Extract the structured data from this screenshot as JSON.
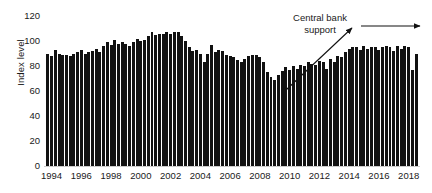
{
  "chart_data": {
    "type": "bar",
    "title": "",
    "xlabel": "",
    "ylabel": "Index level",
    "ylim": [
      0,
      120
    ],
    "yticks": [
      0,
      20,
      40,
      60,
      80,
      100,
      120
    ],
    "xticks": [
      "1994",
      "1996",
      "1998",
      "2000",
      "2002",
      "2004",
      "2006",
      "2008",
      "2010",
      "2012",
      "2014",
      "2016",
      "2018"
    ],
    "grid": false,
    "legend": null,
    "bar_color": "#111111",
    "frequency": "quarterly",
    "x_start": "1994 Q1",
    "x_end": "2018 Q4",
    "annotations": [
      {
        "text": "Central bank support",
        "text_lines": [
          "Central bank",
          "support"
        ],
        "arrows": [
          {
            "type": "diagonal-rising",
            "x1": 286,
            "y1": 90,
            "x2": 353,
            "y2": 27
          },
          {
            "type": "horizontal",
            "x1": 362,
            "y1": 26,
            "x2": 422,
            "y2": 26
          }
        ]
      }
    ],
    "categories": [
      "1994 Q1",
      "1994 Q2",
      "1994 Q3",
      "1994 Q4",
      "1995 Q1",
      "1995 Q2",
      "1995 Q3",
      "1995 Q4",
      "1996 Q1",
      "1996 Q2",
      "1996 Q3",
      "1996 Q4",
      "1997 Q1",
      "1997 Q2",
      "1997 Q3",
      "1997 Q4",
      "1998 Q1",
      "1998 Q2",
      "1998 Q3",
      "1998 Q4",
      "1999 Q1",
      "1999 Q2",
      "1999 Q3",
      "1999 Q4",
      "2000 Q1",
      "2000 Q2",
      "2000 Q3",
      "2000 Q4",
      "2001 Q1",
      "2001 Q2",
      "2001 Q3",
      "2001 Q4",
      "2002 Q1",
      "2002 Q2",
      "2002 Q3",
      "2002 Q4",
      "2003 Q1",
      "2003 Q2",
      "2003 Q3",
      "2003 Q4",
      "2004 Q1",
      "2004 Q2",
      "2004 Q3",
      "2004 Q4",
      "2005 Q1",
      "2005 Q2",
      "2005 Q3",
      "2005 Q4",
      "2006 Q1",
      "2006 Q2",
      "2006 Q3",
      "2006 Q4",
      "2007 Q1",
      "2007 Q2",
      "2007 Q3",
      "2007 Q4",
      "2008 Q1",
      "2008 Q2",
      "2008 Q3",
      "2008 Q4",
      "2009 Q1",
      "2009 Q2",
      "2009 Q3",
      "2009 Q4",
      "2010 Q1",
      "2010 Q2",
      "2010 Q3",
      "2010 Q4",
      "2011 Q1",
      "2011 Q2",
      "2011 Q3",
      "2011 Q4",
      "2012 Q1",
      "2012 Q2",
      "2012 Q3",
      "2012 Q4",
      "2013 Q1",
      "2013 Q2",
      "2013 Q3",
      "2013 Q4",
      "2014 Q1",
      "2014 Q2",
      "2014 Q3",
      "2014 Q4",
      "2015 Q1",
      "2015 Q2",
      "2015 Q3",
      "2015 Q4",
      "2016 Q1",
      "2016 Q2",
      "2016 Q3",
      "2016 Q4",
      "2017 Q1",
      "2017 Q2",
      "2017 Q3",
      "2017 Q4",
      "2018 Q1",
      "2018 Q2",
      "2018 Q3",
      "2018 Q4"
    ],
    "values": [
      90,
      88,
      93,
      90,
      89,
      89,
      88,
      90,
      91,
      93,
      90,
      91,
      92,
      94,
      91,
      96,
      99,
      97,
      101,
      98,
      99,
      98,
      96,
      99,
      102,
      100,
      101,
      104,
      107,
      105,
      106,
      106,
      107,
      106,
      107,
      107,
      104,
      100,
      95,
      92,
      93,
      90,
      83,
      90,
      97,
      91,
      93,
      92,
      89,
      88,
      87,
      85,
      83,
      86,
      88,
      89,
      89,
      87,
      83,
      75,
      71,
      69,
      73,
      76,
      79,
      77,
      80,
      78,
      81,
      80,
      83,
      82,
      81,
      84,
      83,
      78,
      86,
      83,
      88,
      87,
      91,
      94,
      95,
      95,
      93,
      96,
      94,
      95,
      95,
      93,
      95,
      96,
      95,
      92,
      96,
      94,
      96,
      95,
      77,
      90
    ]
  }
}
